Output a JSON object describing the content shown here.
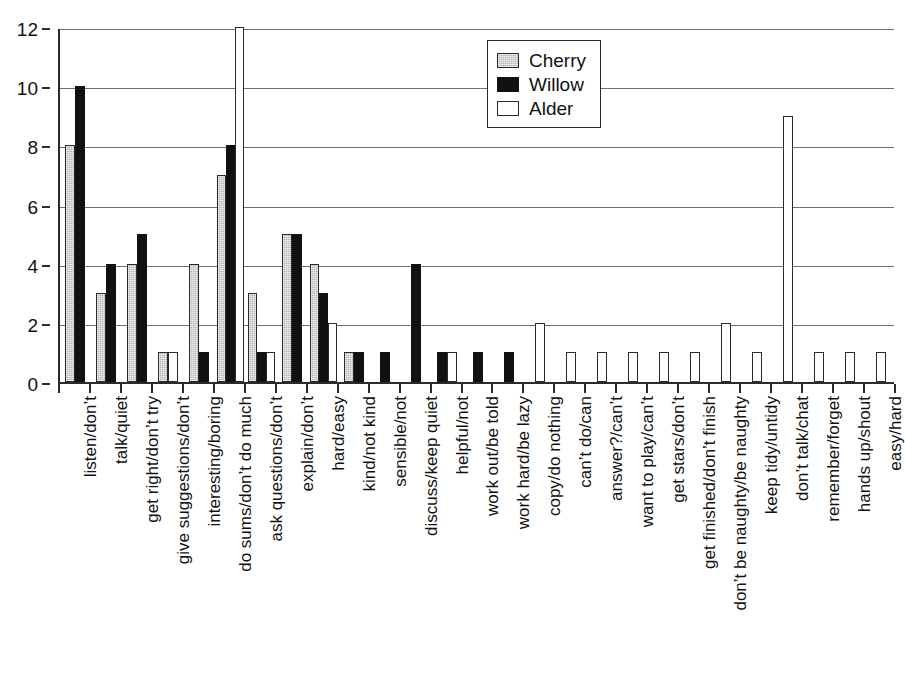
{
  "chart_data": {
    "type": "bar",
    "title": "",
    "subtitle": "",
    "xlabel": "",
    "ylabel": "",
    "ylim": [
      0,
      12
    ],
    "ytick_labels": [
      "0",
      "2",
      "4",
      "6",
      "8",
      "10",
      "12"
    ],
    "ytick_values": [
      0,
      2,
      4,
      6,
      8,
      10,
      12
    ],
    "grid": "horizontal",
    "legend_position": "top-center-right",
    "legend": [
      "Cherry",
      "Willow",
      "Alder"
    ],
    "colors": {
      "Cherry": "#b3b3b3",
      "Willow": "#111111",
      "Alder": "#ffffff",
      "outline": "#2b2b2b",
      "gridline": "#6f6f6f",
      "background": "#ffffff"
    },
    "categories": [
      "listen/don’t",
      "talk/quiet",
      "get right/don’t try",
      "give suggestions/don’t",
      "interesting/boring",
      "do sums/don’t do much",
      "ask questions/don’t",
      "explain/don’t",
      "hard/easy",
      "kind/not kind",
      "sensible/not",
      "discuss/keep quiet",
      "helpful/not",
      "work out/be told",
      "work hard/be lazy",
      "copy/do nothing",
      "can’t do/can",
      "answer?/can’t",
      "want to play/can’t",
      "get stars/don’t",
      "get finished/don’t finish",
      "don’t be naughty/be naughty",
      "keep tidy/untidy",
      "don’t talk/chat",
      "remember/forget",
      "hands up/shout",
      "easy/hard"
    ],
    "series": [
      {
        "name": "Cherry",
        "values": [
          8,
          3,
          4,
          1,
          4,
          7,
          3,
          5,
          4,
          1,
          0,
          0,
          0,
          0,
          0,
          0,
          0,
          0,
          0,
          0,
          0,
          0,
          0,
          0,
          0,
          0,
          0
        ]
      },
      {
        "name": "Willow",
        "values": [
          10,
          4,
          5,
          0,
          1,
          8,
          1,
          5,
          3,
          1,
          1,
          4,
          1,
          1,
          1,
          0,
          0,
          0,
          0,
          0,
          0,
          0,
          0,
          0,
          0,
          0,
          0
        ]
      },
      {
        "name": "Alder",
        "values": [
          0,
          0,
          0,
          1,
          0,
          12,
          1,
          0,
          2,
          0,
          0,
          0,
          1,
          0,
          0,
          2,
          1,
          1,
          1,
          1,
          1,
          2,
          1,
          9,
          1,
          1,
          1
        ]
      }
    ]
  }
}
